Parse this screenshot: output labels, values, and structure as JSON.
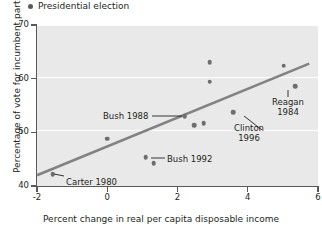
{
  "legend": {
    "marker": "filled-circle",
    "label": "Presidential election"
  },
  "axes": {
    "x": {
      "title": "Percent change in real per capita disposable income",
      "ticks": [
        "-2",
        "0",
        "2",
        "4",
        "6"
      ],
      "tickvals": [
        -2,
        0,
        2,
        4,
        6
      ],
      "range": [
        -2,
        6
      ]
    },
    "y": {
      "title": "Percentage of vote for incumbent party",
      "ticks": [
        "40",
        "50",
        "60",
        "70"
      ],
      "tickvals": [
        40,
        50,
        60,
        70
      ],
      "range": [
        40,
        70
      ]
    }
  },
  "annotations": [
    {
      "id": "carter-1980",
      "text": "Carter 1980",
      "lines": [
        "Carter 1980"
      ],
      "x": 66,
      "y": 178,
      "leader": {
        "x1": 64,
        "y1": 176,
        "x2": 54,
        "y2": 174
      },
      "align": "left"
    },
    {
      "id": "bush-1988",
      "text": "Bush 1988",
      "lines": [
        "Bush 1988"
      ],
      "x": 103,
      "y": 112,
      "leader": {
        "x1": 152,
        "y1": 116,
        "x2": 182,
        "y2": 116
      },
      "align": "left"
    },
    {
      "id": "bush-1992",
      "text": "Bush 1992",
      "lines": [
        "Bush 1992"
      ],
      "x": 167,
      "y": 155,
      "leader": {
        "x1": 151,
        "y1": 158,
        "x2": 165,
        "y2": 158
      },
      "align": "left"
    },
    {
      "id": "clinton-1996",
      "text": "Clinton 1996",
      "lines": [
        "Clinton",
        "1996"
      ],
      "x": 249,
      "y": 124,
      "leader": {
        "x1": 244,
        "y1": 116,
        "x2": 262,
        "y2": 130
      },
      "align": "center"
    },
    {
      "id": "reagan-1984",
      "text": "Reagan 1984",
      "lines": [
        "Reagan",
        "1984"
      ],
      "x": 288,
      "y": 98,
      "leader": {
        "x1": 288,
        "y1": 90,
        "x2": 288,
        "y2": 97
      },
      "align": "center"
    }
  ],
  "chart_data": {
    "type": "scatter",
    "title": "",
    "xlabel": "Percent change in real per capita disposable income",
    "ylabel": "Percentage of vote for incumbent party",
    "xlim": [
      -2,
      6
    ],
    "ylim": [
      40,
      70
    ],
    "grid": "horizontal-white",
    "legend_position": "top-left",
    "series": [
      {
        "name": "Presidential election",
        "marker": "filled-circle",
        "color": "#6d6e71",
        "points": [
          {
            "x": -1.55,
            "y": 42.2,
            "label": "Carter 1980"
          },
          {
            "x": 0.0,
            "y": 48.8,
            "label": ""
          },
          {
            "x": 1.1,
            "y": 45.4,
            "label": "Bush 1992"
          },
          {
            "x": 1.32,
            "y": 44.3,
            "label": "Bush 1992"
          },
          {
            "x": 2.2,
            "y": 53.0,
            "label": "Bush 1988"
          },
          {
            "x": 2.48,
            "y": 51.3,
            "label": ""
          },
          {
            "x": 2.75,
            "y": 51.7,
            "label": ""
          },
          {
            "x": 2.92,
            "y": 63.1,
            "label": ""
          },
          {
            "x": 2.92,
            "y": 59.4,
            "label": ""
          },
          {
            "x": 3.58,
            "y": 53.8,
            "label": "Clinton 1996"
          },
          {
            "x": 5.02,
            "y": 62.4,
            "label": ""
          },
          {
            "x": 5.35,
            "y": 58.6,
            "label": "Reagan 1984"
          }
        ]
      }
    ],
    "fit_line": {
      "type": "linear-regression",
      "color": "#808285",
      "endpoints": [
        {
          "x": -2.0,
          "y": 42.0
        },
        {
          "x": 5.75,
          "y": 62.8
        }
      ]
    }
  }
}
